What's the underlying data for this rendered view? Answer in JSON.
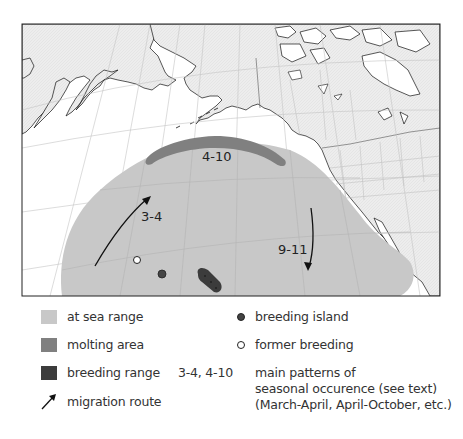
{
  "map": {
    "colors": {
      "land": "#ececec",
      "ocean": "#ffffff",
      "at_sea_range": "#c8c8c8",
      "molting_area": "#808080",
      "breeding_range": "#3c3c3c",
      "graticule": "#c4c4c4",
      "coastline": "#111111"
    },
    "labels": {
      "molting": "4-10",
      "spring_migration": "3-4",
      "fall_migration": "9-11"
    }
  },
  "legend": {
    "left": [
      {
        "key": "at_sea_range",
        "label": "at sea range",
        "color": "#c8c8c8"
      },
      {
        "key": "molting_area",
        "label": "molting area",
        "color": "#808080"
      },
      {
        "key": "breeding_range",
        "label": "breeding range",
        "color": "#3c3c3c"
      },
      {
        "key": "migration_route",
        "label": "migration route"
      }
    ],
    "right": [
      {
        "key": "breeding_island",
        "label": "breeding island"
      },
      {
        "key": "former_breeding",
        "label": "former breeding"
      }
    ],
    "patterns": {
      "code": "3-4, 4-10",
      "line1": "main patterns of",
      "line2": "seasonal occurence (see text)",
      "line3": "(March-April, April-October, etc.)"
    }
  }
}
